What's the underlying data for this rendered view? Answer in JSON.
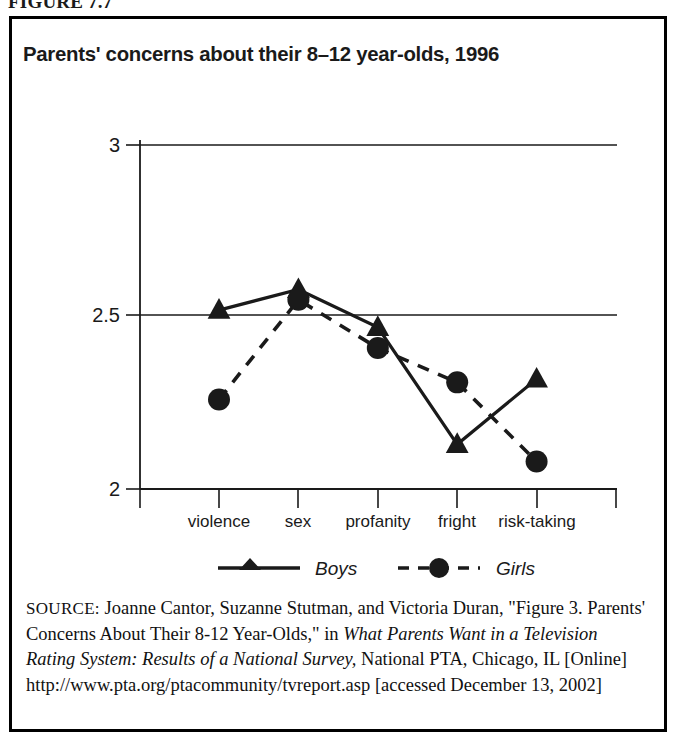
{
  "figure": {
    "label": "FIGURE 7.7",
    "title": "Parents' concerns about their 8–12 year-olds, 1996"
  },
  "chart_data": {
    "type": "line",
    "title": "Parents' concerns about their 8–12 year-olds, 1996",
    "xlabel": "",
    "ylabel": "",
    "categories": [
      "violence",
      "sex",
      "profanity",
      "fright",
      "risk-taking"
    ],
    "series": [
      {
        "name": "Boys",
        "marker": "triangle",
        "line": "solid",
        "values": [
          2.52,
          2.58,
          2.47,
          2.13,
          2.32
        ]
      },
      {
        "name": "Girls",
        "marker": "circle",
        "line": "dashed",
        "values": [
          2.26,
          2.55,
          2.41,
          2.31,
          2.08
        ]
      }
    ],
    "ylim": [
      2,
      3
    ],
    "yticks": [
      2,
      2.5,
      3
    ],
    "ytick_labels": [
      "2",
      "2.5",
      "3"
    ],
    "grid": "horizontal",
    "legend_position": "bottom",
    "legend": [
      "Boys",
      "Girls"
    ]
  },
  "source": {
    "label": "SOURCE:",
    "part1": " Joanne Cantor, Suzanne Stutman, and Victoria Duran, \"Figure 3. Parents' Concerns About Their 8-12 Year-Olds,\" in ",
    "italic1": "What Parents Want in a Television Rating System: Results of a National Survey,",
    "part2": " National PTA, Chicago, IL [Online] http://www.pta.org/ptacommunity/tvreport.asp [accessed December 13, 2002]"
  },
  "colors": {
    "ink": "#1a1a1a",
    "border": "#000000",
    "background": "#ffffff"
  }
}
